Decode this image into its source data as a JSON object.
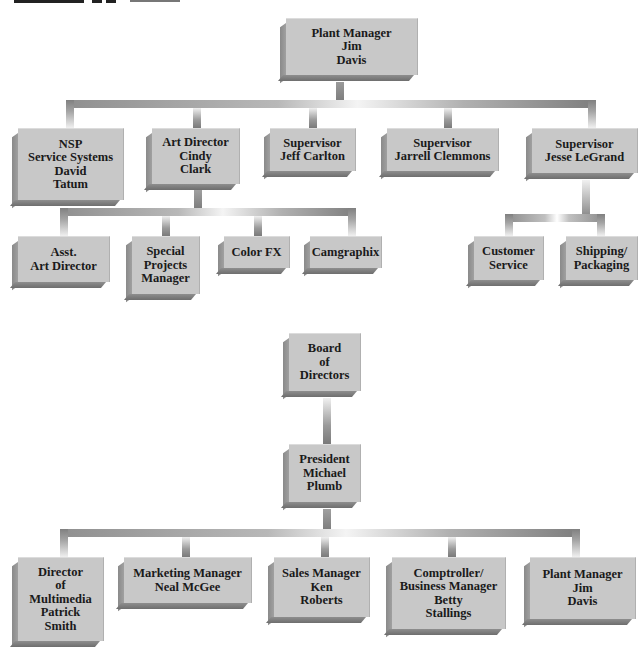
{
  "colors": {
    "box_face": "#c8c8c8",
    "box_shadow": "#7e7e7e",
    "connector_dark": "#7e7e7e",
    "connector_light": "#f4f4f4",
    "text": "#1a1a1a"
  },
  "chart_top": {
    "root": {
      "lines": [
        "Plant Manager",
        "Jim",
        "Davis"
      ]
    },
    "level1": [
      {
        "lines": [
          "NSP",
          "Service Systems",
          "David",
          "Tatum"
        ]
      },
      {
        "lines": [
          "Art Director",
          "Cindy",
          "Clark"
        ]
      },
      {
        "lines": [
          "Supervisor",
          "Jeff Carlton"
        ]
      },
      {
        "lines": [
          "Supervisor",
          "Jarrell Clemmons"
        ]
      },
      {
        "lines": [
          "Supervisor",
          "Jesse LeGrand"
        ]
      }
    ],
    "art_director_reports": [
      {
        "lines": [
          "Asst.",
          "Art Director"
        ]
      },
      {
        "lines": [
          "Special",
          "Projects",
          "Manager"
        ]
      },
      {
        "lines": [
          "Color FX"
        ]
      },
      {
        "lines": [
          "Camgraphix"
        ]
      }
    ],
    "legrand_reports": [
      {
        "lines": [
          "Customer",
          "Service"
        ]
      },
      {
        "lines": [
          "Shipping/",
          "Packaging"
        ]
      }
    ]
  },
  "chart_bottom": {
    "board": {
      "lines": [
        "Board",
        "of",
        "Directors"
      ]
    },
    "president": {
      "lines": [
        "President",
        "Michael",
        "Plumb"
      ]
    },
    "reports": [
      {
        "lines": [
          "Director",
          "of",
          "Multimedia",
          "Patrick",
          "Smith"
        ]
      },
      {
        "lines": [
          "Marketing Manager",
          "Neal McGee"
        ]
      },
      {
        "lines": [
          "Sales Manager",
          "Ken",
          "Roberts"
        ]
      },
      {
        "lines": [
          "Comptroller/",
          "Business Manager",
          "Betty",
          "Stallings"
        ]
      },
      {
        "lines": [
          "Plant Manager",
          "Jim",
          "Davis"
        ]
      }
    ]
  }
}
